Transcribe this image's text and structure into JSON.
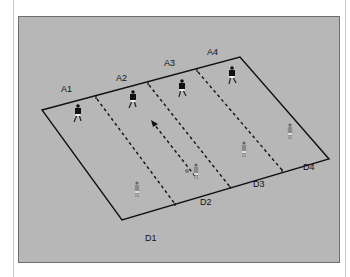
{
  "diagram": {
    "type": "training-drill-field",
    "colors": {
      "panel": "#b7b7b7",
      "lines": "#111111",
      "attacker": "#111111",
      "defender": "#9a9a9a",
      "ball": "#7a7a7a"
    },
    "top_labels": [
      "A1",
      "A2",
      "A3",
      "A4"
    ],
    "bottom_labels": [
      "D1",
      "D2",
      "D3",
      "D4"
    ],
    "attackers": [
      {
        "id": "A1",
        "x": 78,
        "y": 112
      },
      {
        "id": "A2",
        "x": 133,
        "y": 98
      },
      {
        "id": "A3",
        "x": 182,
        "y": 87
      },
      {
        "id": "A4",
        "x": 232,
        "y": 74
      }
    ],
    "defenders": [
      {
        "id": "D1",
        "x": 137,
        "y": 190
      },
      {
        "id": "D2",
        "x": 196,
        "y": 172
      },
      {
        "id": "D3",
        "x": 244,
        "y": 150
      },
      {
        "id": "D4",
        "x": 290,
        "y": 132
      }
    ],
    "ball": {
      "x": 187,
      "y": 171
    },
    "pass_arrow": {
      "from": [
        195,
        178
      ],
      "to": [
        152,
        122
      ]
    }
  }
}
